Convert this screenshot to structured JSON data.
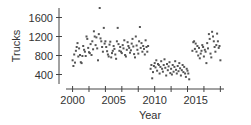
{
  "chart_data": {
    "type": "scatter",
    "title": "",
    "xlabel": "Year",
    "ylabel": "Trucks",
    "xlim": [
      1999.2,
      2018.2
    ],
    "ylim": [
      200,
      1800
    ],
    "xticks": [
      2000,
      2002,
      2004,
      2006,
      2008,
      2010,
      2012,
      2014,
      2016,
      2018
    ],
    "xtick_labels": [
      "2000",
      "2005",
      "2010",
      "2015"
    ],
    "xtick_label_values": [
      2000,
      2005,
      2010,
      2015
    ],
    "yticks": [
      400,
      800,
      1200,
      1600
    ],
    "ytick_labels": [
      "400",
      "800",
      "1200",
      "1600"
    ],
    "grid": false,
    "legend": null,
    "point_color": "#555555",
    "series": [
      {
        "name": "Trucks",
        "points": [
          [
            2000.0,
            700
          ],
          [
            2000.1,
            580
          ],
          [
            2000.2,
            820
          ],
          [
            2000.3,
            650
          ],
          [
            2000.4,
            900
          ],
          [
            2000.5,
            980
          ],
          [
            2000.6,
            1060
          ],
          [
            2000.7,
            780
          ],
          [
            2000.8,
            950
          ],
          [
            2000.9,
            810
          ],
          [
            2001.0,
            660
          ],
          [
            2001.1,
            640
          ],
          [
            2001.2,
            790
          ],
          [
            2001.3,
            1000
          ],
          [
            2001.4,
            920
          ],
          [
            2001.5,
            880
          ],
          [
            2001.6,
            790
          ],
          [
            2001.7,
            1200
          ],
          [
            2001.8,
            1150
          ],
          [
            2001.9,
            960
          ],
          [
            2002.0,
            870
          ],
          [
            2002.1,
            850
          ],
          [
            2002.2,
            1040
          ],
          [
            2002.3,
            810
          ],
          [
            2002.4,
            1100
          ],
          [
            2002.5,
            930
          ],
          [
            2002.6,
            1310
          ],
          [
            2002.7,
            1200
          ],
          [
            2002.8,
            1020
          ],
          [
            2002.9,
            1180
          ],
          [
            2003.0,
            950
          ],
          [
            2003.1,
            700
          ],
          [
            2003.2,
            1250
          ],
          [
            2003.3,
            1800
          ],
          [
            2003.4,
            1160
          ],
          [
            2003.5,
            1100
          ],
          [
            2003.6,
            980
          ],
          [
            2003.7,
            880
          ],
          [
            2003.8,
            1380
          ],
          [
            2003.9,
            1050
          ],
          [
            2004.0,
            1100
          ],
          [
            2004.1,
            980
          ],
          [
            2004.2,
            890
          ],
          [
            2004.3,
            820
          ],
          [
            2004.4,
            780
          ],
          [
            2004.5,
            1030
          ],
          [
            2004.6,
            1090
          ],
          [
            2004.7,
            760
          ],
          [
            2004.8,
            850
          ],
          [
            2004.9,
            900
          ],
          [
            2005.0,
            1000
          ],
          [
            2005.1,
            940
          ],
          [
            2005.2,
            820
          ],
          [
            2005.3,
            730
          ],
          [
            2005.4,
            1100
          ],
          [
            2005.5,
            1380
          ],
          [
            2005.6,
            1040
          ],
          [
            2005.7,
            900
          ],
          [
            2005.8,
            980
          ],
          [
            2005.9,
            880
          ],
          [
            2006.0,
            850
          ],
          [
            2006.1,
            1020
          ],
          [
            2006.2,
            950
          ],
          [
            2006.3,
            1120
          ],
          [
            2006.4,
            810
          ],
          [
            2006.5,
            780
          ],
          [
            2006.6,
            920
          ],
          [
            2006.7,
            1080
          ],
          [
            2006.8,
            1000
          ],
          [
            2006.9,
            960
          ],
          [
            2007.0,
            860
          ],
          [
            2007.1,
            910
          ],
          [
            2007.2,
            1050
          ],
          [
            2007.3,
            1150
          ],
          [
            2007.4,
            990
          ],
          [
            2007.5,
            830
          ],
          [
            2007.6,
            760
          ],
          [
            2007.7,
            1200
          ],
          [
            2007.8,
            1010
          ],
          [
            2007.9,
            920
          ],
          [
            2008.0,
            840
          ],
          [
            2008.1,
            1100
          ],
          [
            2008.2,
            1400
          ],
          [
            2008.3,
            960
          ],
          [
            2008.4,
            1060
          ],
          [
            2008.5,
            880
          ],
          [
            2008.6,
            1000
          ],
          [
            2008.7,
            940
          ],
          [
            2008.8,
            820
          ],
          [
            2008.9,
            1120
          ],
          [
            2009.0,
            980
          ],
          [
            2009.1,
            880
          ],
          [
            2009.2,
            1000
          ],
          [
            2009.5,
            520
          ],
          [
            2009.6,
            600
          ],
          [
            2009.7,
            320
          ],
          [
            2009.8,
            450
          ],
          [
            2009.9,
            580
          ],
          [
            2010.0,
            640
          ],
          [
            2010.1,
            550
          ],
          [
            2010.2,
            700
          ],
          [
            2010.3,
            480
          ],
          [
            2010.4,
            620
          ],
          [
            2010.5,
            600
          ],
          [
            2010.6,
            420
          ],
          [
            2010.7,
            560
          ],
          [
            2010.8,
            680
          ],
          [
            2010.9,
            520
          ],
          [
            2011.0,
            460
          ],
          [
            2011.1,
            600
          ],
          [
            2011.2,
            720
          ],
          [
            2011.3,
            540
          ],
          [
            2011.4,
            380
          ],
          [
            2011.5,
            620
          ],
          [
            2011.6,
            490
          ],
          [
            2011.7,
            570
          ],
          [
            2011.8,
            660
          ],
          [
            2011.9,
            430
          ],
          [
            2012.0,
            520
          ],
          [
            2012.1,
            400
          ],
          [
            2012.2,
            600
          ],
          [
            2012.3,
            460
          ],
          [
            2012.4,
            560
          ],
          [
            2012.5,
            680
          ],
          [
            2012.6,
            500
          ],
          [
            2012.7,
            420
          ],
          [
            2012.8,
            580
          ],
          [
            2012.9,
            470
          ],
          [
            2013.0,
            640
          ],
          [
            2013.1,
            530
          ],
          [
            2013.2,
            380
          ],
          [
            2013.3,
            490
          ],
          [
            2013.4,
            600
          ],
          [
            2013.5,
            450
          ],
          [
            2013.6,
            560
          ],
          [
            2013.7,
            420
          ],
          [
            2013.8,
            350
          ],
          [
            2013.9,
            520
          ],
          [
            2014.0,
            480
          ],
          [
            2014.1,
            420
          ],
          [
            2014.2,
            300
          ],
          [
            2014.6,
            900
          ],
          [
            2014.7,
            1080
          ],
          [
            2014.8,
            1100
          ],
          [
            2014.9,
            940
          ],
          [
            2015.0,
            1050
          ],
          [
            2015.1,
            880
          ],
          [
            2015.2,
            1000
          ],
          [
            2015.3,
            800
          ],
          [
            2015.4,
            960
          ],
          [
            2015.5,
            740
          ],
          [
            2015.6,
            840
          ],
          [
            2015.7,
            900
          ],
          [
            2015.8,
            1020
          ],
          [
            2015.9,
            980
          ],
          [
            2016.0,
            780
          ],
          [
            2016.1,
            920
          ],
          [
            2016.2,
            880
          ],
          [
            2016.3,
            640
          ],
          [
            2016.4,
            1060
          ],
          [
            2016.5,
            950
          ],
          [
            2016.6,
            1250
          ],
          [
            2016.7,
            1150
          ],
          [
            2016.8,
            840
          ],
          [
            2016.9,
            760
          ],
          [
            2017.0,
            1300
          ],
          [
            2017.1,
            1200
          ],
          [
            2017.2,
            1100
          ],
          [
            2017.3,
            980
          ],
          [
            2017.4,
            880
          ],
          [
            2017.5,
            1020
          ],
          [
            2017.6,
            1260
          ],
          [
            2017.7,
            1100
          ],
          [
            2017.8,
            960
          ],
          [
            2017.9,
            1000
          ],
          [
            2018.0,
            700
          ]
        ]
      }
    ]
  }
}
